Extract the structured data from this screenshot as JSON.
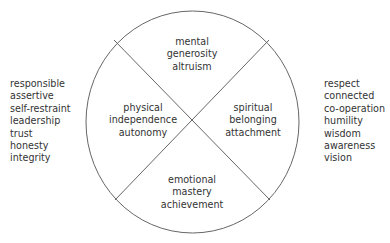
{
  "diagram": {
    "type": "quadrant-circle",
    "quadrants": {
      "top": {
        "lines": [
          "mental",
          "generosity",
          "altruism"
        ]
      },
      "left": {
        "lines": [
          "physical",
          "independence",
          "autonomy"
        ]
      },
      "right": {
        "lines": [
          "spiritual",
          "belonging",
          "attachment"
        ]
      },
      "bottom": {
        "lines": [
          "emotional",
          "mastery",
          "achievement"
        ]
      }
    },
    "left_list": [
      "responsible",
      "assertive",
      "self-restraint",
      "leadership",
      "trust",
      "honesty",
      "integrity"
    ],
    "right_list": [
      "respect",
      "connected",
      "co-operation",
      "humility",
      "wisdom",
      "awareness",
      "vision"
    ],
    "colors": {
      "stroke": "#555555",
      "text": "#333333"
    }
  }
}
